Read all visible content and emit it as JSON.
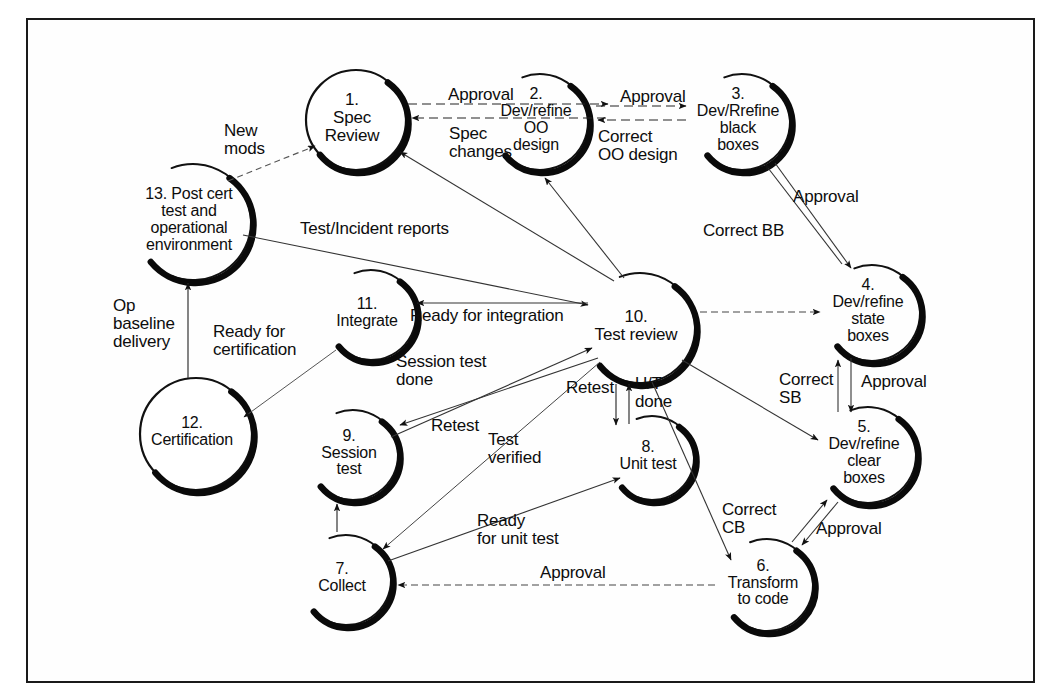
{
  "diagram": {
    "type": "process-flow-diagram",
    "border_color": "#1a1a1a",
    "ink_color": "#0d0d0d",
    "background": "#ffffff",
    "node_shape_note": "bubble / crescent with heavy drop-shadow arc"
  },
  "nodes": [
    {
      "id": "n1",
      "number": "1.",
      "name": "Spec\nReview",
      "label": "1.\nSpec\nReview",
      "cx": 356,
      "cy": 120,
      "r": 50,
      "shape": "circle",
      "font": 17
    },
    {
      "id": "n2",
      "number": "2.",
      "name": "Dev/refine\nOO\ndesign",
      "label": "2.\nDev/refine\nOO\ndesign",
      "cx": 540,
      "cy": 122,
      "r": 48,
      "shape": "crescent",
      "font": 16
    },
    {
      "id": "n3",
      "number": "3.",
      "name": "Dev/Rrefine\nblack\nboxes",
      "label": "3.\nDev/Rrefine\nblack\nboxes",
      "cx": 742,
      "cy": 122,
      "r": 48,
      "shape": "crescent",
      "font": 16
    },
    {
      "id": "n4",
      "number": "4.",
      "name": "Dev/refine\nstate\nboxes",
      "label": "4.\nDev/refine\nstate\nboxes",
      "cx": 872,
      "cy": 313,
      "r": 48,
      "shape": "crescent",
      "font": 16
    },
    {
      "id": "n5",
      "number": "5.",
      "name": "Dev/refine\nclear\nboxes",
      "label": "5.\nDev/refine\nclear\nboxes",
      "cx": 868,
      "cy": 455,
      "r": 48,
      "shape": "crescent",
      "font": 16
    },
    {
      "id": "n6",
      "number": "6.",
      "name": "Transform\nto code",
      "label": "6.\nTransform\nto code",
      "cx": 767,
      "cy": 585,
      "r": 46,
      "shape": "crescent",
      "font": 16
    },
    {
      "id": "n7",
      "number": "7.",
      "name": "Collect",
      "label": "7.\nCollect",
      "cx": 346,
      "cy": 580,
      "r": 45,
      "shape": "crescent",
      "font": 16
    },
    {
      "id": "n8",
      "number": "8.",
      "name": "Unit test",
      "label": "8.\nUnit test",
      "cx": 652,
      "cy": 458,
      "r": 42,
      "shape": "crescent",
      "font": 16
    },
    {
      "id": "n9",
      "number": "9.",
      "name": "Session\ntest",
      "label": "9.\nSession\ntest",
      "cx": 353,
      "cy": 455,
      "r": 45,
      "shape": "crescent",
      "font": 16
    },
    {
      "id": "n10",
      "number": "10.",
      "name": "Test review",
      "label": "10.\nTest review",
      "cx": 640,
      "cy": 328,
      "r": 55,
      "shape": "crescent",
      "font": 17
    },
    {
      "id": "n11",
      "number": "11.",
      "name": "Integrate",
      "label": "11.\nIntegrate",
      "cx": 371,
      "cy": 315,
      "r": 45,
      "shape": "crescent",
      "font": 16
    },
    {
      "id": "n12",
      "number": "12.",
      "name": "Certification",
      "label": "12.\nCertification",
      "cx": 196,
      "cy": 434,
      "r": 56,
      "shape": "circle",
      "font": 16
    },
    {
      "id": "n13",
      "number": "13.",
      "name": "Post cert\ntest and\noperational\nenvironment",
      "label": "13. Post cert\ntest and\noperational\nenvironment",
      "cx": 193,
      "cy": 222,
      "r": 58,
      "shape": "crescent",
      "font": 16
    }
  ],
  "edge_labels": [
    {
      "id": "e-approval-1-2",
      "text": "Approval",
      "x": 448,
      "y": 86,
      "align": "left",
      "font": 17
    },
    {
      "id": "e-spec-changes",
      "text": "Spec\nchanges",
      "x": 449,
      "y": 125,
      "align": "left",
      "font": 17
    },
    {
      "id": "e-approval-2-3",
      "text": "Approval",
      "x": 620,
      "y": 88,
      "align": "left",
      "font": 17
    },
    {
      "id": "e-correct-oo",
      "text": "Correct\nOO design",
      "x": 598,
      "y": 128,
      "align": "left",
      "font": 17
    },
    {
      "id": "e-new-mods",
      "text": "New\nmods",
      "x": 224,
      "y": 122,
      "align": "left",
      "font": 17
    },
    {
      "id": "e-test-incident",
      "text": "Test/Incident reports",
      "x": 300,
      "y": 220,
      "align": "left",
      "font": 17
    },
    {
      "id": "e-approval-3-4",
      "text": "Approval",
      "x": 793,
      "y": 188,
      "align": "left",
      "font": 17
    },
    {
      "id": "e-correct-bb",
      "text": "Correct BB",
      "x": 703,
      "y": 222,
      "align": "left",
      "font": 17
    },
    {
      "id": "e-correct-sb",
      "text": "Correct\nSB",
      "x": 779,
      "y": 371,
      "align": "left",
      "font": 17
    },
    {
      "id": "e-approval-4-5",
      "text": "Approval",
      "x": 861,
      "y": 373,
      "align": "left",
      "font": 17
    },
    {
      "id": "e-correct-cb",
      "text": "Correct\nCB",
      "x": 722,
      "y": 501,
      "align": "left",
      "font": 17
    },
    {
      "id": "e-approval-5-6",
      "text": "Approval",
      "x": 816,
      "y": 520,
      "align": "left",
      "font": 17
    },
    {
      "id": "e-approval-6-7",
      "text": "Approval",
      "x": 540,
      "y": 564,
      "align": "left",
      "font": 17
    },
    {
      "id": "e-ready-unit-test",
      "text": "Ready\nfor unit test",
      "x": 477,
      "y": 512,
      "align": "left",
      "font": 17
    },
    {
      "id": "e-test-verified",
      "text": "Test\nverified",
      "x": 488,
      "y": 431,
      "align": "left",
      "font": 17
    },
    {
      "id": "e-retest-9",
      "text": "Retest",
      "x": 431,
      "y": 417,
      "align": "left",
      "font": 17
    },
    {
      "id": "e-session-test-done",
      "text": "Session test\ndone",
      "x": 396,
      "y": 353,
      "align": "left",
      "font": 17
    },
    {
      "id": "e-ready-integration",
      "text": "Ready for integration",
      "x": 410,
      "y": 307,
      "align": "left",
      "font": 17
    },
    {
      "id": "e-retest-8",
      "text": "Retest",
      "x": 566,
      "y": 379,
      "align": "left",
      "font": 17
    },
    {
      "id": "e-ut-done",
      "text": "U/T\ndone",
      "x": 635,
      "y": 375,
      "align": "left",
      "font": 17
    },
    {
      "id": "e-ready-cert",
      "text": "Ready for\ncertification",
      "x": 213,
      "y": 323,
      "align": "left",
      "font": 17
    },
    {
      "id": "e-op-baseline",
      "text": "Op\nbaseline\ndelivery",
      "x": 113,
      "y": 297,
      "align": "left",
      "font": 17
    }
  ],
  "edges": [
    {
      "from": "n1",
      "to": "n2",
      "label": "Approval",
      "style": "dashed"
    },
    {
      "from": "n2",
      "to": "n1",
      "label": "Spec changes",
      "style": "dashed"
    },
    {
      "from": "n2",
      "to": "n3",
      "label": "Approval",
      "style": "dashed"
    },
    {
      "from": "n3",
      "to": "n2",
      "label": "Correct OO design",
      "style": "dashed"
    },
    {
      "from": "n13",
      "to": "n1",
      "label": "New mods",
      "style": "dashed"
    },
    {
      "from": "n13",
      "to": "n10",
      "label": "Test/Incident reports",
      "style": "solid"
    },
    {
      "from": "n10",
      "to": "n1",
      "label": "",
      "style": "solid"
    },
    {
      "from": "n10",
      "to": "n2",
      "label": "",
      "style": "solid"
    },
    {
      "from": "n3",
      "to": "n4",
      "label": "Approval",
      "style": "solid"
    },
    {
      "from": "n4",
      "to": "n3",
      "label": "Correct BB",
      "style": "solid"
    },
    {
      "from": "n4",
      "to": "n5",
      "label": "Approval",
      "style": "solid"
    },
    {
      "from": "n5",
      "to": "n4",
      "label": "Correct SB",
      "style": "solid"
    },
    {
      "from": "n5",
      "to": "n6",
      "label": "Approval",
      "style": "solid"
    },
    {
      "from": "n6",
      "to": "n5",
      "label": "Correct CB",
      "style": "solid"
    },
    {
      "from": "n6",
      "to": "n7",
      "label": "Approval",
      "style": "dashed"
    },
    {
      "from": "n7",
      "to": "n8",
      "label": "Ready for unit test",
      "style": "solid"
    },
    {
      "from": "n8",
      "to": "n10",
      "label": "U/T done",
      "style": "solid"
    },
    {
      "from": "n10",
      "to": "n8",
      "label": "Retest",
      "style": "solid"
    },
    {
      "from": "n10",
      "to": "n9",
      "label": "Retest",
      "style": "solid"
    },
    {
      "from": "n9",
      "to": "n10",
      "label": "Session test done",
      "style": "solid"
    },
    {
      "from": "n10",
      "to": "n7",
      "label": "Test verified",
      "style": "solid"
    },
    {
      "from": "n10",
      "to": "n11",
      "label": "Ready for integration",
      "style": "solid"
    },
    {
      "from": "n10",
      "to": "n4",
      "label": "",
      "style": "dashed"
    },
    {
      "from": "n10",
      "to": "n5",
      "label": "",
      "style": "solid"
    },
    {
      "from": "n10",
      "to": "n6",
      "label": "",
      "style": "solid"
    },
    {
      "from": "n11",
      "to": "n12",
      "label": "Ready for certification",
      "style": "solid"
    },
    {
      "from": "n12",
      "to": "n13",
      "label": "Op baseline delivery",
      "style": "solid"
    }
  ]
}
